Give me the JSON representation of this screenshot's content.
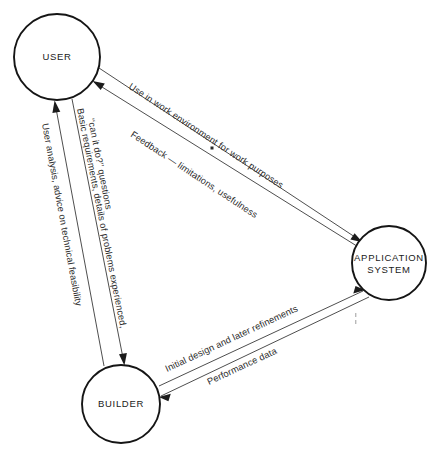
{
  "diagram": {
    "type": "triangular-relationship-diagram",
    "background_color": "#ffffff",
    "line_color": "#3a3a3a",
    "text_color": "#2b2b2b",
    "nodes": [
      {
        "id": "user",
        "label": "USER",
        "cx": 57,
        "cy": 57,
        "r": 43
      },
      {
        "id": "application_system",
        "label_line1": "APPLICATION",
        "label_line2": "SYSTEM",
        "cx": 389,
        "cy": 263,
        "r": 37
      },
      {
        "id": "builder",
        "label": "BUILDER",
        "cx": 121,
        "cy": 404,
        "r": 39
      }
    ],
    "edges": [
      {
        "id": "user-to-system-use",
        "label": "Use in work environment for work purposes",
        "from": "user",
        "to": "application_system",
        "direction": "user → application system"
      },
      {
        "id": "system-to-user-feedback",
        "label": "Feedback — limitations, usefulness",
        "from": "application_system",
        "to": "user",
        "direction": "application system → user"
      },
      {
        "id": "user-to-builder-requirements",
        "label_line1": "Basic requirements, details of problems experienced,",
        "label_line2": "‘‘can it do?’’ questions",
        "from": "user",
        "to": "builder",
        "direction": "user → builder"
      },
      {
        "id": "builder-to-user-analysis",
        "label": "User analysis, advice on technical feasibility",
        "from": "builder",
        "to": "user",
        "direction": "builder → user"
      },
      {
        "id": "builder-to-system-design",
        "label": "Initial design and later refinements",
        "from": "builder",
        "to": "application_system",
        "direction": "builder → application system"
      },
      {
        "id": "system-to-builder-performance",
        "label": "Performance data",
        "from": "application_system",
        "to": "builder",
        "direction": "application system → builder"
      }
    ]
  }
}
